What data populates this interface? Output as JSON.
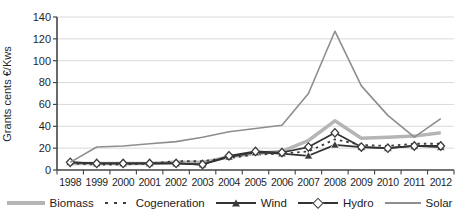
{
  "chart_data": {
    "type": "line",
    "title": "",
    "xlabel": "",
    "ylabel": "Grants cents €/Kws",
    "ylim": [
      0,
      140
    ],
    "yticks": [
      0,
      20,
      40,
      60,
      80,
      100,
      120,
      140
    ],
    "categories": [
      "1998",
      "1999",
      "2000",
      "2001",
      "2002",
      "2003",
      "2004",
      "2005",
      "2006",
      "2007",
      "2008",
      "2009",
      "2010",
      "2011",
      "2012"
    ],
    "grid": "horizontal",
    "legend_position": "bottom",
    "axis_color": "#454545",
    "gridline_color": "#d9d9d9",
    "tick_label_color": "#1f1f1f",
    "series": [
      {
        "name": "Biomass",
        "color": "#b5b5b5",
        "style": "solid",
        "stroke_width": 3.5,
        "marker": "none",
        "values": [
          6,
          6,
          6,
          6,
          7,
          7,
          12,
          15,
          17,
          27,
          45,
          29,
          30,
          31,
          34
        ]
      },
      {
        "name": "Cogeneration",
        "color": "#3d3d3d",
        "style": "dotted",
        "stroke_width": 1.8,
        "marker": "none",
        "values": [
          6,
          5,
          5,
          6,
          8,
          8,
          11,
          14,
          15,
          17,
          28,
          23,
          22,
          24,
          24
        ]
      },
      {
        "name": "Wind",
        "color": "#333333",
        "style": "solid",
        "stroke_width": 1.7,
        "marker": "triangle",
        "marker_color": "#3a3a3a",
        "values": [
          7,
          6,
          6,
          6,
          6,
          5,
          12,
          16,
          15,
          13,
          23,
          21,
          20,
          22,
          21
        ]
      },
      {
        "name": "Hydro",
        "color": "#333333",
        "style": "solid",
        "stroke_width": 1.7,
        "marker": "diamond",
        "marker_color": "#3a3a3a",
        "values": [
          7,
          6,
          6,
          6,
          6,
          5,
          13,
          17,
          16,
          21,
          34,
          21,
          20,
          22,
          22
        ]
      },
      {
        "name": "Solar",
        "color": "#8e8e8e",
        "style": "solid",
        "stroke_width": 1.6,
        "marker": "none",
        "values": [
          7,
          21,
          22,
          24,
          26,
          30,
          35,
          38,
          41,
          70,
          127,
          77,
          50,
          30,
          47
        ]
      }
    ]
  }
}
